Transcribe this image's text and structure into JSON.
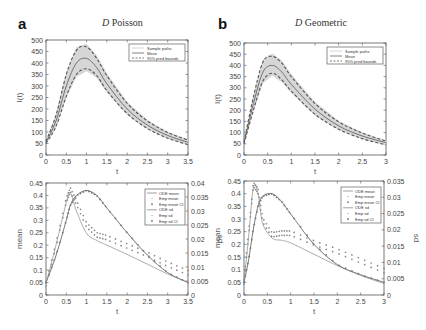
{
  "panels": [
    {
      "letter": "a",
      "title_italic": "D",
      "title_rest": " Poisson"
    },
    {
      "letter": "b",
      "title_italic": "D",
      "title_rest": " Geometric"
    }
  ],
  "chart_data": [
    {
      "id": "a-top",
      "type": "line",
      "title": "D Poisson",
      "xlabel": "t",
      "ylabel": "I(t)",
      "xlim": [
        0,
        3.5
      ],
      "ylim": [
        0,
        500
      ],
      "xticks": [
        0,
        0.5,
        1,
        1.5,
        2,
        2.5,
        3,
        3.5
      ],
      "yticks": [
        0,
        50,
        100,
        150,
        200,
        250,
        300,
        350,
        400,
        450,
        500
      ],
      "legend": [
        "Sample paths",
        "Mean",
        "95% pred bounds"
      ],
      "legend_position": "upper right",
      "x": [
        0,
        0.25,
        0.5,
        0.75,
        1.0,
        1.25,
        1.5,
        2.0,
        2.5,
        3.0,
        3.5
      ],
      "series": [
        {
          "name": "Mean",
          "values": [
            55,
            150,
            300,
            400,
            420,
            380,
            310,
            200,
            130,
            85,
            55
          ]
        },
        {
          "name": "95% pred bounds upper",
          "values": [
            60,
            175,
            350,
            455,
            470,
            420,
            345,
            225,
            148,
            98,
            65
          ]
        },
        {
          "name": "95% pred bounds lower",
          "values": [
            50,
            125,
            255,
            350,
            375,
            345,
            280,
            180,
            115,
            73,
            45
          ]
        }
      ]
    },
    {
      "id": "b-top",
      "type": "line",
      "title": "D Geometric",
      "xlabel": "t",
      "ylabel": "I(t)",
      "xlim": [
        0,
        3
      ],
      "ylim": [
        0,
        500
      ],
      "xticks": [
        0,
        0.5,
        1,
        1.5,
        2,
        2.5,
        3
      ],
      "yticks": [
        0,
        50,
        100,
        150,
        200,
        250,
        300,
        350,
        400,
        450,
        500
      ],
      "legend": [
        "Sample paths",
        "Mean",
        "95% pred bounds"
      ],
      "legend_position": "upper right",
      "x": [
        0,
        0.2,
        0.4,
        0.6,
        0.8,
        1.0,
        1.5,
        2.0,
        2.5,
        3.0
      ],
      "series": [
        {
          "name": "Mean",
          "values": [
            55,
            230,
            370,
            400,
            370,
            315,
            205,
            130,
            85,
            55
          ]
        },
        {
          "name": "95% pred bounds upper",
          "values": [
            60,
            260,
            415,
            440,
            410,
            350,
            230,
            148,
            98,
            62
          ]
        },
        {
          "name": "95% pred bounds lower",
          "values": [
            50,
            200,
            330,
            365,
            335,
            285,
            182,
            115,
            73,
            45
          ]
        }
      ]
    },
    {
      "id": "a-bottom",
      "type": "line",
      "xlabel": "t",
      "ylabel": "mean",
      "ylabel_right": "sd",
      "xlim": [
        0,
        3.5
      ],
      "ylim": [
        0,
        0.45
      ],
      "ylim_right": [
        0,
        0.04
      ],
      "xticks": [
        0,
        0.5,
        1,
        1.5,
        2,
        2.5,
        3,
        3.5
      ],
      "yticks": [
        0,
        0.05,
        0.1,
        0.15,
        0.2,
        0.25,
        0.3,
        0.35,
        0.4,
        0.45
      ],
      "yticks_right": [
        0,
        0.005,
        0.01,
        0.015,
        0.02,
        0.025,
        0.03,
        0.035,
        0.04
      ],
      "legend": [
        "ODE mean",
        "Emp mean",
        "Emp mean CI",
        "ODE sd",
        "Emp sd",
        "Emp sd CI"
      ],
      "legend_position": "upper right",
      "x": [
        0,
        0.25,
        0.5,
        0.6,
        0.75,
        1.0,
        1.25,
        1.5,
        2.0,
        2.5,
        3.0,
        3.5
      ],
      "series": [
        {
          "name": "ODE mean",
          "values": [
            0.05,
            0.16,
            0.3,
            0.36,
            0.4,
            0.42,
            0.4,
            0.35,
            0.25,
            0.16,
            0.09,
            0.05
          ]
        },
        {
          "name": "ODE sd",
          "values": [
            0.004,
            0.018,
            0.033,
            0.0365,
            0.03,
            0.022,
            0.0195,
            0.0178,
            0.0145,
            0.011,
            0.0075,
            0.0045
          ]
        },
        {
          "name": "Emp sd",
          "values": [
            0.004,
            0.018,
            0.034,
            0.0375,
            0.033,
            0.025,
            0.0215,
            0.0205,
            0.0175,
            0.0145,
            0.011,
            0.008
          ]
        }
      ]
    },
    {
      "id": "b-bottom",
      "type": "line",
      "xlabel": "t",
      "ylabel": "mean",
      "ylabel_right": "sd",
      "xlim": [
        0,
        3
      ],
      "ylim": [
        0,
        0.45
      ],
      "ylim_right": [
        0,
        0.035
      ],
      "xticks": [
        0,
        0.5,
        1,
        1.5,
        2,
        2.5,
        3
      ],
      "yticks": [
        0,
        0.05,
        0.1,
        0.15,
        0.2,
        0.25,
        0.3,
        0.35,
        0.4,
        0.45
      ],
      "yticks_right": [
        0,
        0.005,
        0.01,
        0.015,
        0.02,
        0.025,
        0.03,
        0.035
      ],
      "legend": [
        "ODE mean",
        "Emp mean",
        "Emp mean CI",
        "ODE sd",
        "Emp sd",
        "Emp sd CI"
      ],
      "legend_position": "upper right",
      "x": [
        0,
        0.1,
        0.2,
        0.3,
        0.4,
        0.6,
        0.8,
        1.0,
        1.5,
        2.0,
        2.5,
        3.0
      ],
      "series": [
        {
          "name": "ODE mean",
          "values": [
            0.05,
            0.14,
            0.26,
            0.35,
            0.39,
            0.4,
            0.37,
            0.32,
            0.2,
            0.12,
            0.08,
            0.05
          ]
        },
        {
          "name": "ODE sd",
          "values": [
            0.004,
            0.018,
            0.033,
            0.031,
            0.022,
            0.0175,
            0.0168,
            0.016,
            0.0125,
            0.009,
            0.006,
            0.0035
          ]
        },
        {
          "name": "Emp sd",
          "values": [
            0.004,
            0.019,
            0.034,
            0.032,
            0.023,
            0.0185,
            0.019,
            0.019,
            0.016,
            0.0135,
            0.0105,
            0.0075
          ]
        }
      ]
    }
  ]
}
